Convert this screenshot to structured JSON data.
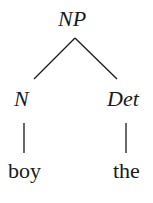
{
  "tree": {
    "root": {
      "label": "NP"
    },
    "children": [
      {
        "label": "N",
        "word": "boy"
      },
      {
        "label": "Det",
        "word": "the"
      }
    ]
  },
  "colors": {
    "ink": "#1a1a1a",
    "background": "#ffffff"
  }
}
